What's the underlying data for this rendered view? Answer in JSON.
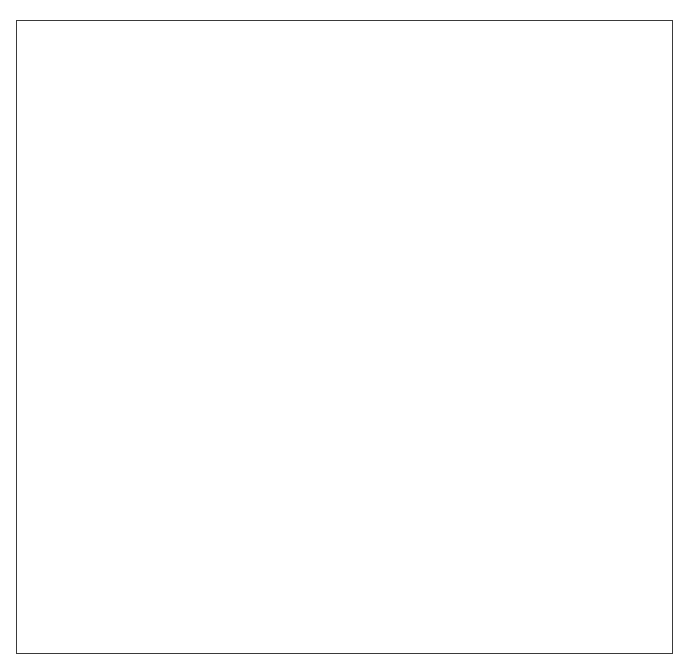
{
  "diagram": {
    "box_fill": "#bfbfbf",
    "box_stroke": "#2b2b2b",
    "frame_stroke": "#3a3a3a",
    "line_color": "#1f1f1f",
    "background": "#ffffff",
    "caption": "Departmental directors",
    "nodes": [
      {
        "id": "board-of-trustees",
        "label": "Board of\ntrustees",
        "x": 327,
        "y": 40,
        "w": 77,
        "h": 39
      },
      {
        "id": "medical-staff",
        "label": "Medical\nstaff",
        "x": 98,
        "y": 66,
        "w": 66,
        "h": 39
      },
      {
        "id": "chief-executive-officer",
        "label": "Chief\nexecutive\nofficer",
        "x": 327,
        "y": 91,
        "w": 77,
        "h": 52
      },
      {
        "id": "director-of-performance-improvement",
        "label": "Director of\nperformance\nimprovement",
        "x": 425,
        "y": 132,
        "w": 86,
        "h": 51
      },
      {
        "id": "vice-president-hospital-services",
        "label": "Vice president for\nhospital services",
        "x": 140,
        "y": 213,
        "w": 109,
        "h": 51
      },
      {
        "id": "vice-president-client-care-services",
        "label": "Vice president\nclient care services",
        "x": 431,
        "y": 211,
        "w": 129,
        "h": 53
      },
      {
        "id": "finance-and-information-director",
        "label": "Finance and\ninformation\ndirector",
        "x": 52,
        "y": 338,
        "w": 81,
        "h": 55
      },
      {
        "id": "engineering-and-maintenance-director",
        "label": "Engineering\nand maintenance\ndirector",
        "x": 144,
        "y": 338,
        "w": 103,
        "h": 55
      },
      {
        "id": "purchasing-director",
        "label": "Purchasing\ndirector",
        "x": 257,
        "y": 338,
        "w": 76,
        "h": 48
      },
      {
        "id": "housekeeping-and-laundry-director",
        "label": "Housekeeping\nand laundry\ndirector",
        "x": 96,
        "y": 423,
        "w": 97,
        "h": 56
      },
      {
        "id": "food-services-director",
        "label": "Food services\ndirector",
        "x": 204,
        "y": 423,
        "w": 97,
        "h": 56
      },
      {
        "id": "social-work-director",
        "label": "Social work\ndirector",
        "x": 348,
        "y": 309,
        "w": 79,
        "h": 46
      },
      {
        "id": "rehabilitation-and-recreation-director",
        "label": "Rehabilitation\nand recreation\ndirector",
        "x": 452,
        "y": 309,
        "w": 92,
        "h": 60
      },
      {
        "id": "pharmacy-director",
        "label": "Pharmacy\ndirector",
        "x": 567,
        "y": 309,
        "w": 72,
        "h": 46
      },
      {
        "id": "health-records-director",
        "label": "Health records\ndirector",
        "x": 388,
        "y": 382,
        "w": 98,
        "h": 48
      },
      {
        "id": "nursing-director",
        "label": "Nursing\ndirector",
        "x": 512,
        "y": 382,
        "w": 86,
        "h": 48
      },
      {
        "id": "nurse-manager-unit-a",
        "label": "Nurse manager\nUnit A",
        "x": 424,
        "y": 461,
        "w": 96,
        "h": 46
      },
      {
        "id": "nurse-manager-unit-b",
        "label": "Nurse manager\nUnit B",
        "x": 533,
        "y": 461,
        "w": 96,
        "h": 46
      },
      {
        "id": "charge-nurse-unit-b",
        "label": "Charge nurse\nUnit B",
        "x": 538,
        "y": 525,
        "w": 96,
        "h": 46
      },
      {
        "id": "treatment-nurse",
        "label": "Treatment\nnurse",
        "x": 424,
        "y": 592,
        "w": 77,
        "h": 46
      },
      {
        "id": "medication-nurse",
        "label": "Medication\nnurse",
        "x": 545,
        "y": 592,
        "w": 77,
        "h": 46
      }
    ],
    "caption_position": {
      "x": 147,
      "y": 288
    },
    "edges": [
      {
        "from": "board-of-trustees",
        "to": "medical-staff",
        "style": "solid"
      },
      {
        "from": "board-of-trustees",
        "to": "chief-executive-officer",
        "style": "solid"
      },
      {
        "from": "chief-executive-officer",
        "to": "director-of-performance-improvement",
        "style": "dashed"
      },
      {
        "from": "chief-executive-officer",
        "to": "vice-president-hospital-services",
        "style": "solid"
      },
      {
        "from": "chief-executive-officer",
        "to": "vice-president-client-care-services",
        "style": "solid"
      },
      {
        "from": "vice-president-hospital-services",
        "to": "finance-and-information-director",
        "style": "solid"
      },
      {
        "from": "vice-president-hospital-services",
        "to": "engineering-and-maintenance-director",
        "style": "solid"
      },
      {
        "from": "vice-president-hospital-services",
        "to": "purchasing-director",
        "style": "solid"
      },
      {
        "from": "vice-president-hospital-services",
        "to": "housekeeping-and-laundry-director",
        "style": "solid"
      },
      {
        "from": "vice-president-hospital-services",
        "to": "food-services-director",
        "style": "solid"
      },
      {
        "from": "vice-president-client-care-services",
        "to": "social-work-director",
        "style": "solid"
      },
      {
        "from": "vice-president-client-care-services",
        "to": "rehabilitation-and-recreation-director",
        "style": "solid"
      },
      {
        "from": "vice-president-client-care-services",
        "to": "pharmacy-director",
        "style": "solid"
      },
      {
        "from": "vice-president-client-care-services",
        "to": "health-records-director",
        "style": "solid"
      },
      {
        "from": "vice-president-client-care-services",
        "to": "nursing-director",
        "style": "solid"
      },
      {
        "from": "nursing-director",
        "to": "nurse-manager-unit-a",
        "style": "solid"
      },
      {
        "from": "nursing-director",
        "to": "nurse-manager-unit-b",
        "style": "solid"
      },
      {
        "from": "nurse-manager-unit-b",
        "to": "charge-nurse-unit-b",
        "style": "solid"
      },
      {
        "from": "charge-nurse-unit-b",
        "to": "treatment-nurse",
        "style": "solid"
      },
      {
        "from": "charge-nurse-unit-b",
        "to": "medication-nurse",
        "style": "solid"
      }
    ]
  }
}
